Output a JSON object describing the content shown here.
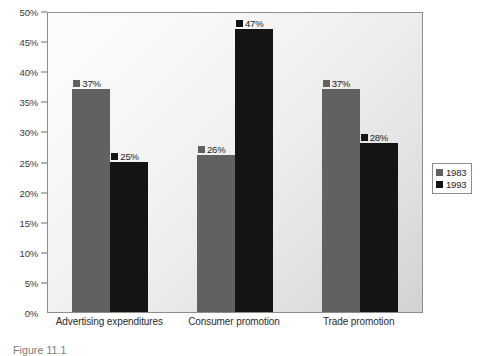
{
  "caption": "Figure 11.1",
  "legend": {
    "position": "right",
    "entries": [
      {
        "label": "1983",
        "color": "#616161"
      },
      {
        "label": "1993",
        "color": "#141414"
      }
    ]
  },
  "axis": {
    "y_ticks": [
      "0%",
      "5%",
      "10%",
      "15%",
      "20%",
      "25%",
      "30%",
      "35%",
      "40%",
      "45%",
      "50%"
    ]
  },
  "chart_data": {
    "type": "bar",
    "title": "",
    "subtitle": "",
    "xlabel": "",
    "ylabel": "",
    "ylim": [
      0,
      50
    ],
    "ytick_step": 5,
    "ytick_suffix": "%",
    "grid": false,
    "categories": [
      "Advertising expenditures",
      "Consumer promotion",
      "Trade promotion"
    ],
    "series": [
      {
        "name": "1983",
        "color": "#616161",
        "values": [
          37,
          26,
          37
        ],
        "labels": [
          "37%",
          "26%",
          "37%"
        ]
      },
      {
        "name": "1993",
        "color": "#141414",
        "values": [
          25,
          47,
          28
        ],
        "labels": [
          "25%",
          "47%",
          "28%"
        ]
      }
    ]
  }
}
